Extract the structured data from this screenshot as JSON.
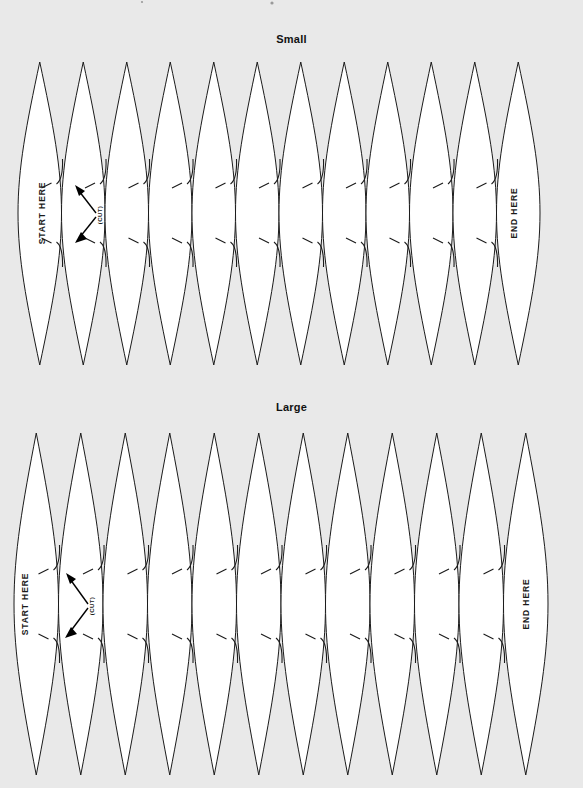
{
  "document": {
    "background_color": "#e9e9e9",
    "ink_color": "#1b1b1b",
    "paper_color": "#ffffff",
    "width": 583,
    "height": 788
  },
  "panels": [
    {
      "id": "small",
      "title": "Small",
      "start_label": "START HERE",
      "end_label": "END HERE",
      "cut_label": "(CUT)",
      "gore_count": 12,
      "geometry": {
        "left": 18,
        "right": 540,
        "top": 7,
        "bottom": 310,
        "mid": 158,
        "slit_upper": 130,
        "slit_lower": 186,
        "pitch": 43.5
      }
    },
    {
      "id": "large",
      "title": "Large",
      "start_label": "START HERE",
      "end_label": "END HERE",
      "cut_label": "(CUT)",
      "gore_count": 12,
      "geometry": {
        "left": 14,
        "right": 548,
        "top": 8,
        "bottom": 350,
        "mid": 179,
        "slit_upper": 146,
        "slit_lower": 212,
        "pitch": 44.5
      }
    }
  ],
  "annotations": {
    "cut_arrow_name": "cut-arrow",
    "dash_name": "cut-dash-line"
  }
}
